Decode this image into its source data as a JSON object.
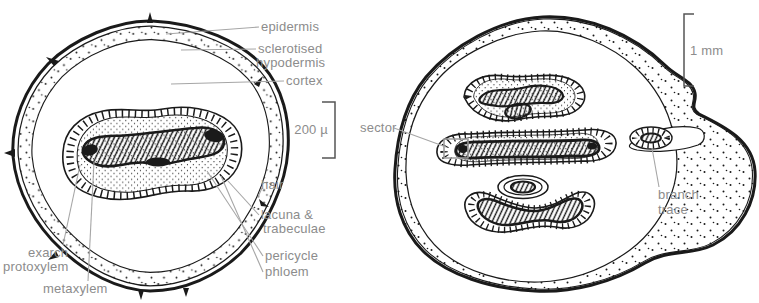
{
  "figure": {
    "left_section": {
      "scale_label": "200 µ",
      "labels": {
        "epidermis": "epidermis",
        "sclerotised_line1": "sclerotised",
        "sclerotised_line2": "hypodermis",
        "cortex": "cortex",
        "hair": "hair",
        "lacuna_line1": "lacuna &",
        "lacuna_line2": "trabeculae",
        "pericycle": "pericycle",
        "phloem": "phloem",
        "exarch_line1": "exarch",
        "exarch_line2": "protoxylem",
        "metaxylem": "metaxylem"
      }
    },
    "right_section": {
      "scale_label": "1 mm",
      "labels": {
        "sector": "sector",
        "branch_line1": "branch",
        "branch_line2": "trace"
      }
    },
    "colors": {
      "ink": "#1a1a1a",
      "label_text": "#8c8c8c",
      "leader_line": "#a6a6a6",
      "background": "#ffffff"
    }
  }
}
